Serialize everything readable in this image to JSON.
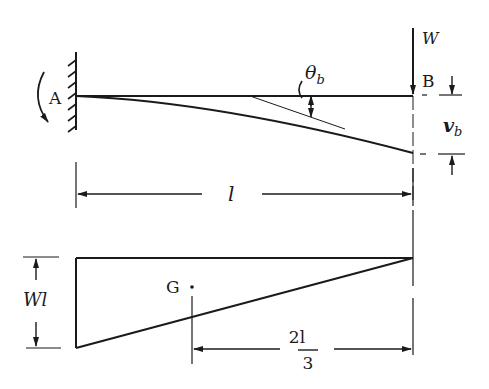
{
  "diagram": {
    "beam": {
      "fixed_end_label": "A",
      "free_end_label": "B",
      "load_label": "W",
      "slope_label": "θ",
      "slope_subscript": "b",
      "deflection_label": "v",
      "deflection_subscript": "b",
      "length_label": "l"
    },
    "moment_diagram": {
      "height_label": "Wl",
      "centroid_label": "G",
      "centroid_distance_numerator": "2l",
      "centroid_distance_denominator": "3"
    },
    "colors": {
      "ink": "#1a1a1a",
      "background": "#ffffff"
    }
  }
}
